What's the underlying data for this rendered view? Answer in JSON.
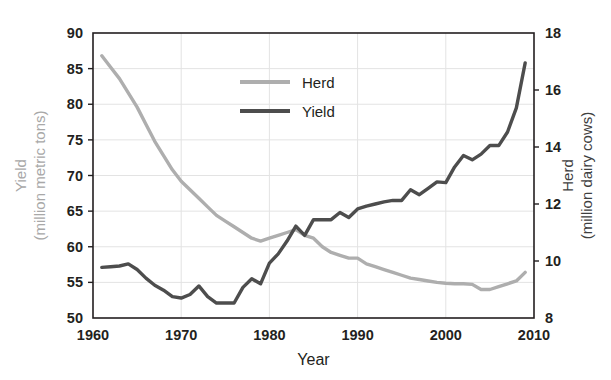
{
  "chart_data": {
    "type": "line",
    "title": "",
    "xlabel": "Year",
    "left_axis": {
      "label_line1": "Yield",
      "label_line2": "(million metric tons)",
      "ticks": [
        50,
        55,
        60,
        65,
        70,
        75,
        80,
        85,
        90
      ],
      "ylim": [
        50,
        90
      ],
      "color": "#a8a8a8"
    },
    "right_axis": {
      "label_line1": "Herd",
      "label_line2": "(million dairy cows)",
      "ticks": [
        8,
        10,
        12,
        14,
        16,
        18
      ],
      "ylim": [
        8,
        18
      ],
      "color": "#3f3f3f"
    },
    "x_ticks": [
      1960,
      1970,
      1980,
      1990,
      2000,
      2010
    ],
    "xlim": [
      1960,
      2010
    ],
    "grid": true,
    "legend_position": "top-center",
    "legend": [
      {
        "name": "Herd",
        "color": "#aeaeae",
        "axis": "right"
      },
      {
        "name": "Yield",
        "color": "#4d4d4d",
        "axis": "left"
      }
    ],
    "series": [
      {
        "name": "Herd",
        "axis": "right",
        "color": "#aeaeae",
        "unit": "million dairy cows",
        "x": [
          1961,
          1962,
          1963,
          1964,
          1965,
          1966,
          1967,
          1968,
          1969,
          1970,
          1971,
          1972,
          1973,
          1974,
          1975,
          1976,
          1977,
          1978,
          1979,
          1980,
          1981,
          1982,
          1983,
          1984,
          1985,
          1986,
          1987,
          1988,
          1989,
          1990,
          1991,
          1992,
          1993,
          1994,
          1995,
          1996,
          1997,
          1998,
          1999,
          2000,
          2001,
          2002,
          2003,
          2004,
          2005,
          2006,
          2007,
          2008,
          2009
        ],
        "values": [
          17.2,
          16.8,
          16.4,
          15.9,
          15.4,
          14.8,
          14.2,
          13.7,
          13.2,
          12.8,
          12.5,
          12.2,
          11.9,
          11.6,
          11.4,
          11.2,
          11.0,
          10.8,
          10.7,
          10.8,
          10.9,
          11.0,
          11.1,
          10.9,
          10.8,
          10.5,
          10.3,
          10.2,
          10.1,
          10.1,
          9.9,
          9.8,
          9.7,
          9.6,
          9.5,
          9.4,
          9.35,
          9.3,
          9.25,
          9.22,
          9.2,
          9.2,
          9.18,
          9.0,
          9.0,
          9.1,
          9.2,
          9.3,
          9.6
        ]
      },
      {
        "name": "Yield",
        "axis": "left",
        "color": "#4d4d4d",
        "unit": "million metric tons",
        "x": [
          1961,
          1962,
          1963,
          1964,
          1965,
          1966,
          1967,
          1968,
          1969,
          1970,
          1971,
          1972,
          1973,
          1974,
          1975,
          1976,
          1977,
          1978,
          1979,
          1980,
          1981,
          1982,
          1983,
          1984,
          1985,
          1986,
          1987,
          1988,
          1989,
          1990,
          1991,
          1992,
          1993,
          1994,
          1995,
          1996,
          1997,
          1998,
          1999,
          2000,
          2001,
          2002,
          2003,
          2004,
          2005,
          2006,
          2007,
          2008,
          2009
        ],
        "values": [
          57.1,
          57.2,
          57.3,
          57.6,
          56.8,
          55.6,
          54.6,
          53.9,
          53.0,
          52.8,
          53.3,
          54.5,
          53.0,
          52.1,
          52.1,
          52.1,
          54.3,
          55.5,
          54.8,
          57.7,
          59.0,
          60.8,
          62.9,
          61.6,
          63.8,
          63.8,
          63.8,
          64.8,
          64.1,
          65.3,
          65.7,
          66.0,
          66.3,
          66.5,
          66.5,
          68.0,
          67.3,
          68.2,
          69.1,
          69.0,
          71.2,
          72.8,
          72.2,
          73.0,
          74.2,
          74.2,
          76.1,
          79.5,
          85.8
        ]
      }
    ],
    "annotations": []
  },
  "colors": {
    "background": "#ffffff",
    "plot_border": "#231f20",
    "gridline": "#e3e3e3",
    "herd": "#aeaeae",
    "yield": "#4d4d4d",
    "text": "#231f20"
  }
}
